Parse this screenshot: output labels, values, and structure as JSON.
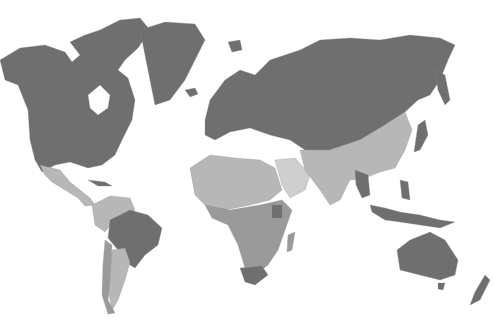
{
  "map": {
    "type": "choropleth world map",
    "style": "grayscale",
    "legend": null,
    "title": null,
    "colors": {
      "background": "#ffffff",
      "dark": "#6f6f6f",
      "mid": "#9a9a9a",
      "light": "#b7b7b7",
      "pale": "#cfcfcf"
    },
    "regions": [
      {
        "name": "North America (Canada, USA, Greenland)",
        "shade": "dark"
      },
      {
        "name": "Mexico & Central America",
        "shade": "light"
      },
      {
        "name": "Brazil",
        "shade": "dark"
      },
      {
        "name": "Northern South America",
        "shade": "light"
      },
      {
        "name": "Argentina",
        "shade": "light"
      },
      {
        "name": "Chile",
        "shade": "mid"
      },
      {
        "name": "Europe & Russia",
        "shade": "dark"
      },
      {
        "name": "North Africa",
        "shade": "light"
      },
      {
        "name": "Arabian Peninsula",
        "shade": "pale"
      },
      {
        "name": "Central & Southern Africa",
        "shade": "mid"
      },
      {
        "name": "South Africa",
        "shade": "dark"
      },
      {
        "name": "Kenya",
        "shade": "dark"
      },
      {
        "name": "Madagascar",
        "shade": "mid"
      },
      {
        "name": "China, Central & South Asia",
        "shade": "light"
      },
      {
        "name": "Japan",
        "shade": "dark"
      },
      {
        "name": "Myanmar",
        "shade": "dark"
      },
      {
        "name": "Southeast Asia & Indonesia",
        "shade": "dark"
      },
      {
        "name": "Australia & New Zealand",
        "shade": "dark"
      }
    ]
  }
}
